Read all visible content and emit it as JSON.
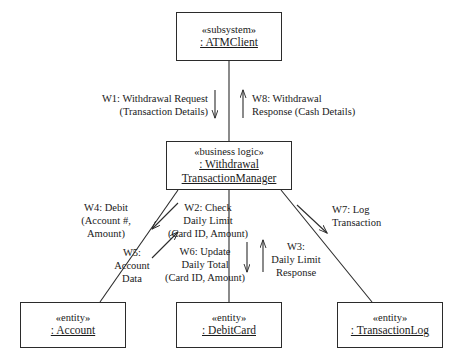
{
  "diagram": {
    "type": "uml-communication-diagram",
    "line_color": "#2b2b2b",
    "background": "#ffffff"
  },
  "nodes": {
    "atm_client": {
      "stereotype": "«subsystem»",
      "name": ": ATMClient"
    },
    "withdrawal_manager": {
      "stereotype": "«business logic»",
      "name": ": Withdrawal TransactionManager",
      "name_line1": ": Withdrawal",
      "name_line2": "TransactionManager"
    },
    "account": {
      "stereotype": "«entity»",
      "name": ": Account"
    },
    "debit_card": {
      "stereotype": "«entity»",
      "name": ": DebitCard"
    },
    "transaction_log": {
      "stereotype": "«entity»",
      "name": ": TransactionLog"
    }
  },
  "messages": {
    "w1": "W1: Withdrawal Request\n(Transaction Details)",
    "w8": "W8: Withdrawal\nResponse (Cash Details)",
    "w4": "W4: Debit\n(Account #,\nAmount)",
    "w5": "W5:\nAccount\nData",
    "w2": "W2: Check\nDaily Limit\n(Card ID, Amount)",
    "w6": "W6: Update\nDaily Total\n(Card ID, Amount)",
    "w3": "W3:\nDaily Limit\nResponse",
    "w7": "W7: Log\nTransaction"
  }
}
